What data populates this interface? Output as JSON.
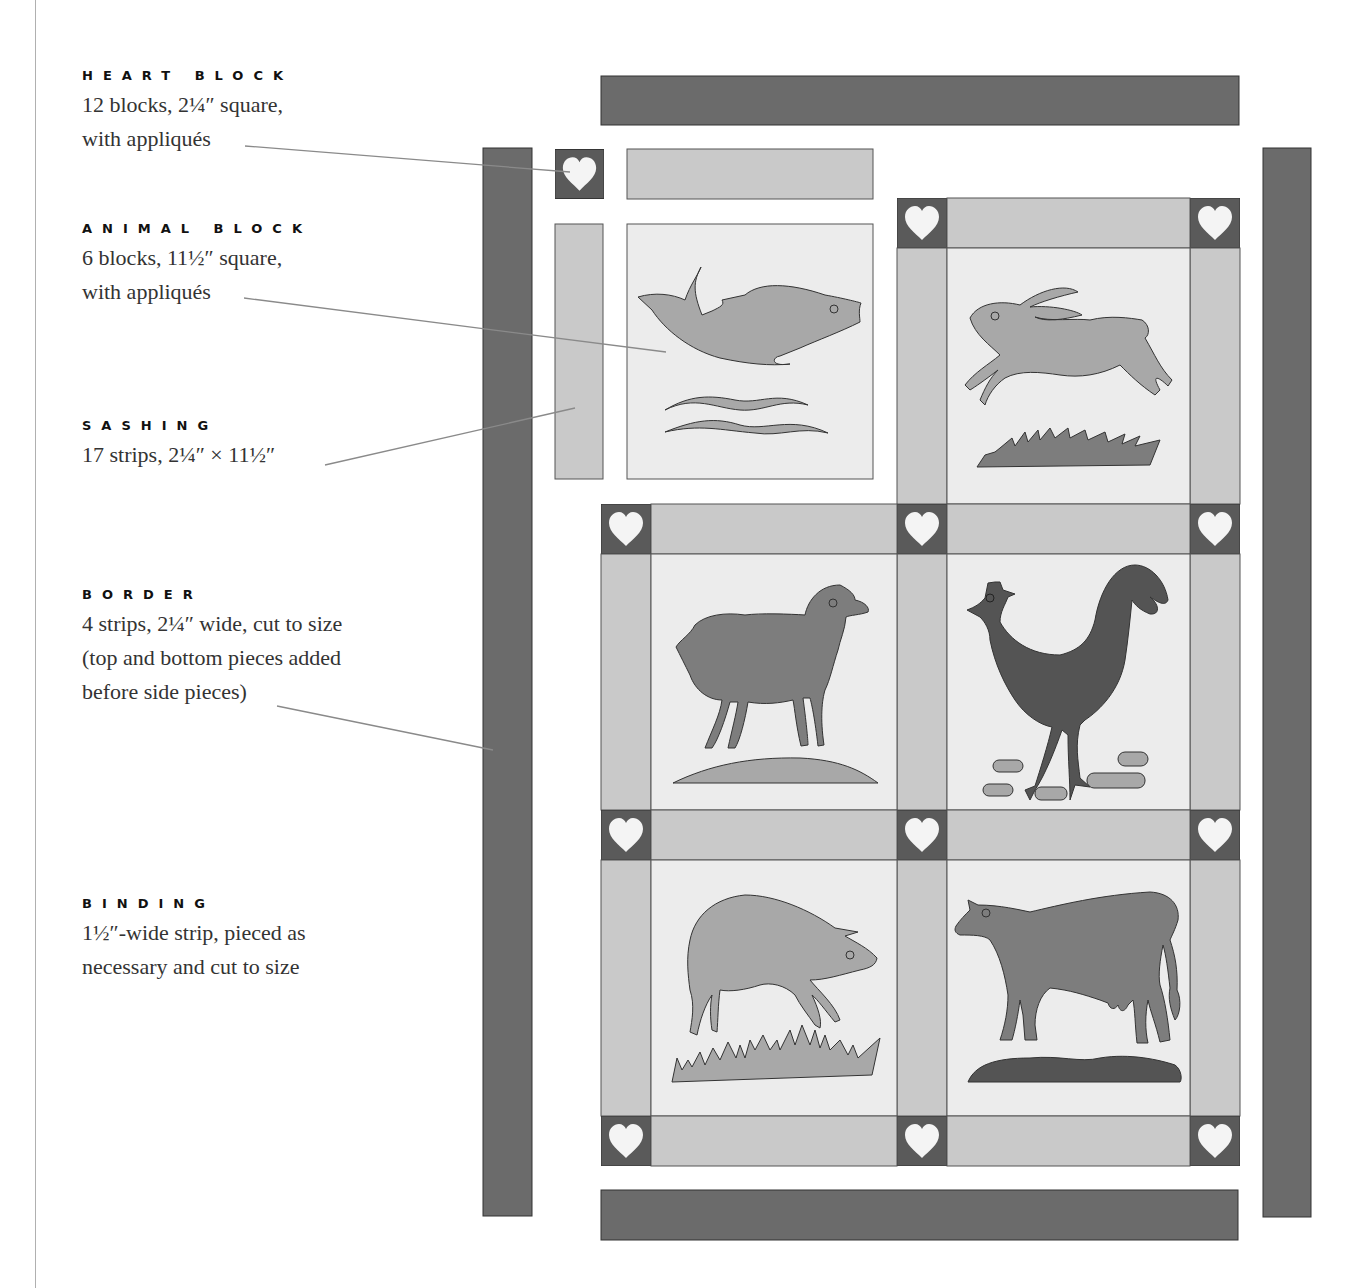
{
  "labels": [
    {
      "id": "heart-block",
      "title": "HEART BLOCK",
      "lines": [
        "12 blocks, 2¼″ square,",
        "with appliqués"
      ]
    },
    {
      "id": "animal-block",
      "title": "ANIMAL BLOCK",
      "lines": [
        "6 blocks, 11½″ square,",
        "with appliqués"
      ]
    },
    {
      "id": "sashing",
      "title": "SASHING",
      "lines": [
        "17 strips, 2¼″ × 11½″"
      ]
    },
    {
      "id": "border",
      "title": "BORDER",
      "lines": [
        "4 strips, 2¼″ wide, cut to size",
        "(top and bottom pieces added",
        "before side pieces)"
      ]
    },
    {
      "id": "binding",
      "title": "BINDING",
      "lines": [
        "1½″-wide strip, pieced as",
        "necessary and cut to size"
      ]
    }
  ],
  "quilt": {
    "animals": [
      "fish",
      "rabbit",
      "sheep",
      "rooster",
      "pig",
      "cow"
    ],
    "colors": {
      "border": "#6b6b6b",
      "heart_block_bg": "#5a5a5a",
      "heart": "#f4f4f4",
      "sashing": "#c9c9c9",
      "block_bg": "#ececec",
      "applique_light": "#a8a8a8",
      "applique_mid": "#7d7d7d",
      "applique_dark": "#545454",
      "leader_line": "#8a8a8a",
      "outline": "#333333"
    }
  }
}
